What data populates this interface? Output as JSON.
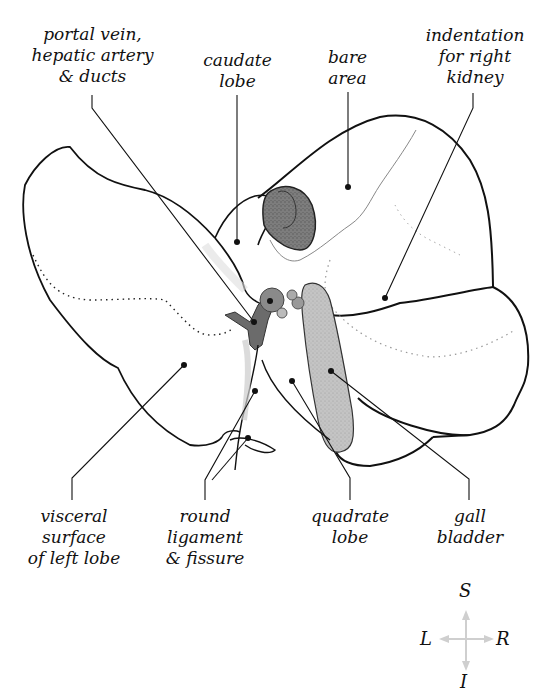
{
  "figure": {
    "colors": {
      "outline": "#111111",
      "gall_bladder": "#bdbdbd",
      "portal_structures": "#6b6b6b",
      "dark_region": "#7a7a7a",
      "compass": "#cfcfcf"
    }
  },
  "labels": {
    "portal_vein": "portal vein,\nhepatic artery\n& ducts",
    "caudate_lobe": "caudate\nlobe",
    "bare_area": "bare\narea",
    "indentation_right_kidney": "indentation\nfor right\nkidney",
    "visceral_surface_left_lobe": "visceral\nsurface\nof left lobe",
    "round_ligament_fissure": "round\nligament\n& fissure",
    "quadrate_lobe": "quadrate\nlobe",
    "gall_bladder": "gall\nbladder"
  },
  "compass": {
    "superior": "S",
    "inferior": "I",
    "left": "L",
    "right": "R"
  }
}
